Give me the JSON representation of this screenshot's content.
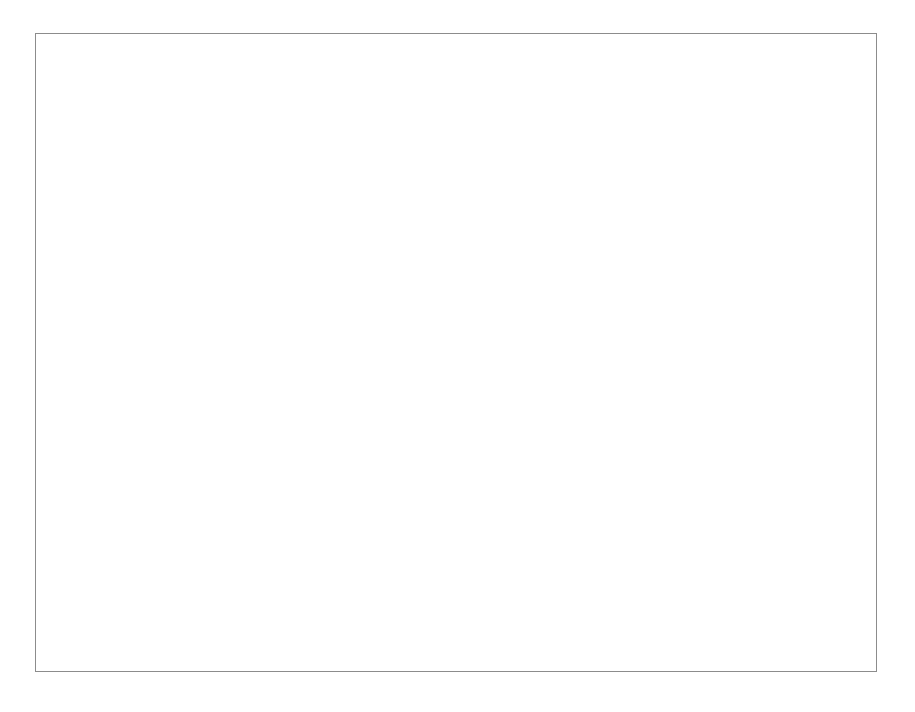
{
  "chart_data": {
    "type": "line",
    "title": "",
    "xlabel": "Year",
    "ylabel": "FDI/GDP Ratio",
    "xlim": [
      1975,
      2015
    ],
    "ylim": [
      0,
      7
    ],
    "xticks": [
      1975,
      1980,
      1985,
      1990,
      1995,
      2000,
      2005,
      2010,
      2015
    ],
    "yticks": [
      0,
      1,
      2,
      3,
      4,
      5,
      6,
      7
    ],
    "grid": true,
    "legend_position": "bottom",
    "series": [
      {
        "name": "China",
        "marker": "diamond",
        "color": "#151515",
        "points": [
          [
            1982,
            0.05
          ],
          [
            1983,
            0.06
          ],
          [
            1984,
            0.07
          ],
          [
            1985,
            0.07
          ],
          [
            1986,
            0.08
          ],
          [
            1987,
            0.12
          ],
          [
            1988,
            1.01
          ],
          [
            1989,
            0.99
          ],
          [
            1990,
            1.0
          ],
          [
            1991,
            1.0
          ],
          [
            1992,
            1.21
          ],
          [
            1992.6,
            2.6
          ],
          [
            1993,
            6.2
          ],
          [
            1993.6,
            6.0
          ],
          [
            1994.6,
            4.9
          ],
          [
            1995.3,
            4.68
          ],
          [
            1996.3,
            4.58
          ],
          [
            1997.3,
            4.28
          ],
          [
            1998.3,
            3.57
          ],
          [
            1999.3,
            3.17
          ],
          [
            2000.3,
            3.22
          ],
          [
            2001.3,
            3.35
          ],
          [
            2002.3,
            2.97
          ],
          [
            2003.3,
            3.17
          ],
          [
            2004.6,
            4.58
          ],
          [
            2005.6,
            4.57
          ],
          [
            2006.6,
            4.48
          ],
          [
            2007.6,
            3.78
          ],
          [
            2008.3,
            3.47
          ],
          [
            2009.0,
            2.57
          ],
          [
            2009.9,
            4.07
          ],
          [
            2011.0,
            3.75
          ],
          [
            2012.0,
            3.07
          ]
        ]
      },
      {
        "name": "India",
        "marker": "circle",
        "color": "#151515",
        "points": [
          [
            1987.6,
            0.03
          ],
          [
            1988.6,
            0.1
          ],
          [
            1989.6,
            0.1
          ],
          [
            1990.6,
            0.03
          ],
          [
            1991.6,
            0.12
          ],
          [
            1992.6,
            0.2
          ],
          [
            1993.6,
            0.31
          ],
          [
            1994.6,
            0.6
          ],
          [
            1995.6,
            0.59
          ],
          [
            1996.6,
            0.79
          ],
          [
            1997.6,
            0.62
          ],
          [
            1998.6,
            0.51
          ],
          [
            1999.6,
            0.79
          ],
          [
            2000.6,
            1.08
          ],
          [
            2001.6,
            1.09
          ],
          [
            2002.6,
            0.71
          ],
          [
            2003.6,
            0.76
          ],
          [
            2004.6,
            0.88
          ],
          [
            2005.6,
            2.07
          ],
          [
            2006.6,
            1.98
          ],
          [
            2008.0,
            3.47
          ],
          [
            2009.0,
            2.57
          ],
          [
            2010.0,
            1.58
          ],
          [
            2011.0,
            1.87
          ],
          [
            2012.0,
            1.27
          ]
        ]
      }
    ]
  },
  "legend": {
    "items": [
      {
        "label": "China",
        "marker": "diamond"
      },
      {
        "label": "India",
        "marker": "circle"
      }
    ]
  }
}
